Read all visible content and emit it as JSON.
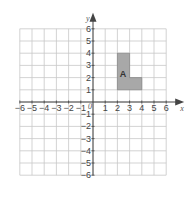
{
  "diagram": {
    "type": "coordinate-grid",
    "x_axis_label": "x",
    "y_axis_label": "y",
    "origin_label": "0",
    "x_range": [
      -6,
      6
    ],
    "y_range": [
      -6,
      6
    ],
    "x_ticks": [
      "-6",
      "-5",
      "-4",
      "-3",
      "-2",
      "-1",
      "1",
      "2",
      "3",
      "4",
      "5",
      "6"
    ],
    "y_ticks": [
      "6",
      "5",
      "4",
      "3",
      "2",
      "1",
      "-1",
      "-2",
      "-3",
      "-4",
      "-5",
      "-6"
    ],
    "shape": {
      "label": "A",
      "fill": "#a8a8a8",
      "vertices": [
        [
          2,
          1
        ],
        [
          2,
          4
        ],
        [
          3,
          4
        ],
        [
          3,
          2
        ],
        [
          4,
          2
        ],
        [
          4,
          1
        ]
      ]
    },
    "grid_color": "#c8c8c8",
    "axis_color": "#444444"
  }
}
